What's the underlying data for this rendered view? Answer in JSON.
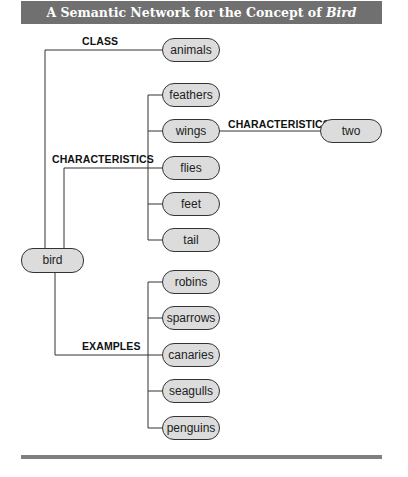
{
  "title": {
    "prefix": "A Semantic Network for the Concept of ",
    "emphasis": "Bird"
  },
  "root": {
    "label": "bird"
  },
  "relations": {
    "class": "CLASS",
    "characteristics": "CHARACTERISTICS",
    "characteristics_sub": "CHARACTERISTICS",
    "examples": "EXAMPLES"
  },
  "class_nodes": [
    "animals"
  ],
  "characteristic_nodes": [
    "feathers",
    "wings",
    "flies",
    "feet",
    "tail"
  ],
  "wing_characteristic": "two",
  "example_nodes": [
    "robins",
    "sparrows",
    "canaries",
    "seagulls",
    "penguins"
  ]
}
